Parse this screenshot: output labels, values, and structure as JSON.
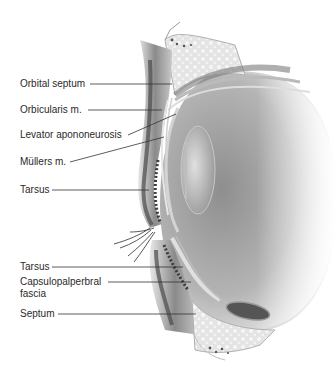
{
  "diagram": {
    "colors": {
      "background": "#ffffff",
      "label_text": "#2a2a2a",
      "leader_line": "#333333",
      "tissue_dark": "#5a5a5a",
      "tissue_mid": "#9a9a9a",
      "tissue_light": "#d8d8d8",
      "globe": "#a8a8a8"
    },
    "labels": [
      {
        "id": "orbital-septum",
        "text": "Orbital septum",
        "x": 20,
        "y": 80
      },
      {
        "id": "orbicularis",
        "text": "Orbicularis m.",
        "x": 20,
        "y": 106
      },
      {
        "id": "levator-aponeurosis",
        "text": "Levator apononeurosis",
        "x": 20,
        "y": 131
      },
      {
        "id": "mullers",
        "text": "Müllers m.",
        "x": 20,
        "y": 158
      },
      {
        "id": "upper-tarsus",
        "text": "Tarsus",
        "x": 20,
        "y": 185
      },
      {
        "id": "lower-tarsus",
        "text": "Tarsus",
        "x": 20,
        "y": 262
      },
      {
        "id": "capsulopalpebral-line1",
        "text": "Capsulopalperbral",
        "x": 20,
        "y": 277
      },
      {
        "id": "capsulopalpebral-line2",
        "text": "fascia",
        "x": 20,
        "y": 290
      },
      {
        "id": "septum",
        "text": "Septum",
        "x": 20,
        "y": 308
      }
    ]
  }
}
